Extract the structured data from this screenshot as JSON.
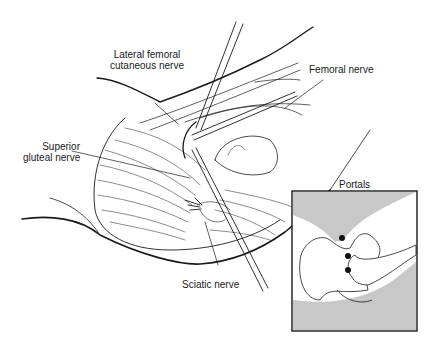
{
  "figure": {
    "labels": {
      "lateral_femoral": [
        "Lateral femoral",
        "cutaneous nerve"
      ],
      "femoral": "Femoral nerve",
      "superior_gluteal": [
        "Superior",
        "gluteal nerve"
      ],
      "sciatic": "Sciatic nerve"
    },
    "inset": {
      "title": "Portals",
      "portal_count": 3,
      "shade_color": "#c8c8c8"
    },
    "colors": {
      "line": "#1a1a1a",
      "background": "#ffffff"
    }
  }
}
